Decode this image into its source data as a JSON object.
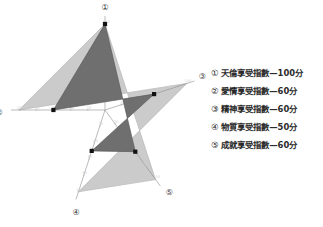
{
  "chart_data": {
    "type": "radar",
    "title": "",
    "categories": [
      "天倫享受指數",
      "愛情享受指數",
      "精神享受指數",
      "物質享受指數",
      "成就享受指數"
    ],
    "axis_markers": [
      "①",
      "②",
      "③",
      "④",
      "⑤"
    ],
    "values": [
      100,
      60,
      60,
      50,
      60
    ],
    "rmax": 100,
    "rmin": 0,
    "tick_values": [
      20,
      40,
      60,
      80,
      100
    ],
    "tick_labels": [
      "20",
      "40",
      "60",
      "80",
      "100"
    ],
    "unit": "分",
    "grid": true,
    "legend_position": "right",
    "colors": {
      "data_fill": "#6e6e6e",
      "grid_fill": "#cfcfcf",
      "outline": "#b4b4b4",
      "marker": "#111111",
      "text": "#2b2b2b"
    }
  },
  "chart": {
    "axes": [
      {
        "marker": "①",
        "name": "天倫享受指數",
        "value": 100
      },
      {
        "marker": "②",
        "name": "愛情享受指數",
        "value": 60
      },
      {
        "marker": "③",
        "name": "精神享受指數",
        "value": 60
      },
      {
        "marker": "④",
        "name": "物質享受指數",
        "value": 50
      },
      {
        "marker": "⑤",
        "name": "成就享受指數",
        "value": 60
      }
    ],
    "ticks": [
      "100",
      "80",
      "60",
      "40",
      "20"
    ]
  },
  "legend": {
    "items": [
      {
        "marker": "①",
        "text": "天倫享受指數—100分"
      },
      {
        "marker": "②",
        "text": "愛情享受指數—60分"
      },
      {
        "marker": "③",
        "text": "精神享受指數—60分"
      },
      {
        "marker": "④",
        "text": "物質享受指數—50分"
      },
      {
        "marker": "⑤",
        "text": "成就享受指數—60分"
      }
    ]
  }
}
